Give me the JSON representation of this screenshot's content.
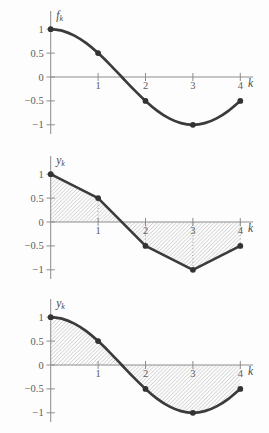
{
  "figure": {
    "plot_count": 3,
    "colors": {
      "curve": "#3b3b3b",
      "point": "#333333",
      "axis": "#8d8d8d",
      "tick_text": "#5c5c5c",
      "hatch": "#b2b2b2",
      "stem": "#7a7a7a",
      "background": "#fdfdfd"
    }
  },
  "smooth_curve": {
    "x": [
      0,
      0.25,
      0.5,
      0.75,
      1,
      1.25,
      1.5,
      1.75,
      2,
      2.25,
      2.5,
      2.75,
      3,
      3.25,
      3.5,
      3.75,
      4
    ],
    "y": [
      1,
      0.966,
      0.866,
      0.707,
      0.5,
      0.259,
      0,
      -0.259,
      -0.5,
      -0.707,
      -0.866,
      -0.966,
      -1,
      -0.966,
      -0.866,
      -0.707,
      -0.5
    ]
  },
  "chart_data": [
    {
      "type": "line",
      "curve": "smooth",
      "hatched": false,
      "stems": [],
      "title": "",
      "ylabel": {
        "base": "f",
        "sub": "k"
      },
      "xlabel": "k",
      "x": [
        0,
        1,
        2,
        3,
        4
      ],
      "values": [
        1,
        0.5,
        -0.5,
        -1,
        -0.5
      ],
      "xtick_values": [
        1,
        2,
        3,
        4
      ],
      "xtick_labels": [
        "1",
        "2",
        "3",
        "4"
      ],
      "ytick_values": [
        1,
        0.5,
        0,
        -0.5,
        -1
      ],
      "ytick_labels": [
        "1",
        "0.5",
        "0",
        "−0.5",
        "−1"
      ],
      "xlim": [
        0,
        4.3
      ],
      "ylim": [
        -1.2,
        1.4
      ],
      "grid": false,
      "legend": null
    },
    {
      "type": "line",
      "curve": "linear",
      "hatched": true,
      "stems": [
        1,
        2,
        3,
        4
      ],
      "title": "",
      "ylabel": {
        "base": "y",
        "sub": "k"
      },
      "xlabel": "k",
      "x": [
        0,
        1,
        2,
        3,
        4
      ],
      "values": [
        1,
        0.5,
        -0.5,
        -1,
        -0.5
      ],
      "xtick_values": [
        1,
        2,
        3,
        4
      ],
      "xtick_labels": [
        "1",
        "2",
        "3",
        "4"
      ],
      "ytick_values": [
        1,
        0.5,
        0,
        -0.5,
        -1
      ],
      "ytick_labels": [
        "1",
        "0.5",
        "0",
        "−0.5",
        "−1"
      ],
      "xlim": [
        0,
        4.3
      ],
      "ylim": [
        -1.2,
        1.4
      ],
      "grid": false,
      "legend": null
    },
    {
      "type": "line",
      "curve": "smooth",
      "hatched": true,
      "stems": [],
      "title": "",
      "ylabel": {
        "base": "y",
        "sub": "k"
      },
      "xlabel": "k",
      "x": [
        0,
        1,
        2,
        3,
        4
      ],
      "values": [
        1,
        0.5,
        -0.5,
        -1,
        -0.5
      ],
      "xtick_values": [
        1,
        2,
        3,
        4
      ],
      "xtick_labels": [
        "1",
        "2",
        "3",
        "4"
      ],
      "ytick_values": [
        1,
        0.5,
        0,
        -0.5,
        -1
      ],
      "ytick_labels": [
        "1",
        "0.5",
        "0",
        "−0.5",
        "−1"
      ],
      "xlim": [
        0,
        4.3
      ],
      "ylim": [
        -1.2,
        1.4
      ],
      "grid": false,
      "legend": null
    }
  ]
}
